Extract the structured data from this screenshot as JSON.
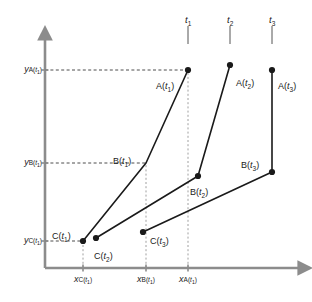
{
  "figure": {
    "type": "scientific-line-diagram",
    "clipped_top_text": "",
    "axis_color": "#8c8c8c",
    "curve_color": "#1a1a1a",
    "dash_color": "#4d4d4d",
    "point_color": "#1a1a1a"
  },
  "axes": {
    "x_axis_label": "",
    "y_axis_label": "",
    "origin": {
      "x": 45,
      "y": 268
    },
    "x_end": 300,
    "y_top": 38
  },
  "time_labels": [
    {
      "id": "t1",
      "text": "t",
      "sub": "1",
      "x": 188,
      "y": 14,
      "tick_x": 188,
      "tick_y1": 26,
      "tick_y2": 44
    },
    {
      "id": "t2",
      "text": "t",
      "sub": "2",
      "x": 230,
      "y": 14,
      "tick_x": 230,
      "tick_y1": 26,
      "tick_y2": 44
    },
    {
      "id": "t3",
      "text": "t",
      "sub": "3",
      "x": 272,
      "y": 14,
      "tick_x": 272,
      "tick_y1": 26,
      "tick_y2": 44
    }
  ],
  "y_ticks": [
    {
      "id": "yA",
      "var": "y",
      "sub_letter": "A",
      "sub_t": "t",
      "sub_n": "1",
      "y": 70,
      "label_x": 6,
      "dash_to_x": 188
    },
    {
      "id": "yB",
      "var": "y",
      "sub_letter": "B",
      "sub_t": "t",
      "sub_n": "1",
      "y": 163,
      "label_x": 6,
      "dash_to_x": 146
    },
    {
      "id": "yC",
      "var": "y",
      "sub_letter": "C",
      "sub_t": "t",
      "sub_n": "1",
      "y": 241,
      "label_x": 6,
      "dash_to_x": 83
    }
  ],
  "x_ticks": [
    {
      "id": "xC",
      "var": "x",
      "sub_letter": "C",
      "sub_t": "t",
      "sub_n": "1",
      "x": 83,
      "label_y": 274,
      "dash_from_y": 241
    },
    {
      "id": "xB",
      "var": "x",
      "sub_letter": "B",
      "sub_t": "t",
      "sub_n": "1",
      "x": 146,
      "label_y": 274,
      "dash_from_y": 163
    },
    {
      "id": "xA",
      "var": "x",
      "sub_letter": "A",
      "sub_t": "t",
      "sub_n": "1",
      "x": 188,
      "label_y": 274,
      "dash_from_y": 70
    }
  ],
  "chart_data": {
    "type": "line",
    "title": "",
    "xlabel": "x",
    "ylabel": "y",
    "series": [
      {
        "name": "t1",
        "points": [
          {
            "label": "C",
            "sub": "1",
            "x": 83,
            "y": 241,
            "marker": true
          },
          {
            "label": "B",
            "sub": "1",
            "x": 146,
            "y": 163,
            "marker": false
          },
          {
            "label": "A",
            "sub": "1",
            "x": 188,
            "y": 70,
            "marker": true
          }
        ]
      },
      {
        "name": "t2",
        "points": [
          {
            "label": "C",
            "sub": "2",
            "x": 96,
            "y": 238,
            "marker": true
          },
          {
            "label": "B",
            "sub": "2",
            "x": 198,
            "y": 176,
            "marker": true
          },
          {
            "label": "A",
            "sub": "2",
            "x": 230,
            "y": 65,
            "marker": true
          }
        ]
      },
      {
        "name": "t3",
        "points": [
          {
            "label": "C",
            "sub": "3",
            "x": 143,
            "y": 232,
            "marker": true
          },
          {
            "label": "B",
            "sub": "3",
            "x": 272,
            "y": 172,
            "marker": true
          },
          {
            "label": "A",
            "sub": "3",
            "x": 272,
            "y": 70,
            "marker": true
          }
        ]
      }
    ]
  },
  "point_labels": [
    {
      "id": "At1",
      "letter": "A",
      "t": "t",
      "n": "1",
      "x": 156,
      "y": 82,
      "anchor": "start"
    },
    {
      "id": "At2",
      "letter": "A",
      "t": "t",
      "n": "2",
      "x": 236,
      "y": 79,
      "anchor": "start"
    },
    {
      "id": "At3",
      "letter": "A",
      "t": "t",
      "n": "3",
      "x": 278,
      "y": 82,
      "anchor": "start"
    },
    {
      "id": "Bt1",
      "letter": "B",
      "t": "t",
      "n": "1",
      "x": 113,
      "y": 157,
      "anchor": "start"
    },
    {
      "id": "Bt2",
      "letter": "B",
      "t": "t",
      "n": "2",
      "x": 190,
      "y": 188,
      "anchor": "start"
    },
    {
      "id": "Bt3",
      "letter": "B",
      "t": "t",
      "n": "3",
      "x": 241,
      "y": 161,
      "anchor": "start"
    },
    {
      "id": "Ct1",
      "letter": "C",
      "t": "t",
      "n": "1",
      "x": 52,
      "y": 232,
      "anchor": "start"
    },
    {
      "id": "Ct2",
      "letter": "C",
      "t": "t",
      "n": "2",
      "x": 94,
      "y": 252,
      "anchor": "start"
    },
    {
      "id": "Ct3",
      "letter": "C",
      "t": "t",
      "n": "3",
      "x": 150,
      "y": 237,
      "anchor": "start"
    }
  ]
}
